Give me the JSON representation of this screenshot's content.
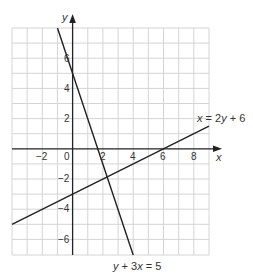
{
  "chart_data": {
    "type": "line",
    "title": "",
    "xlabel": "x",
    "ylabel": "y",
    "xlim": [
      -4,
      9
    ],
    "ylim": [
      -7,
      8
    ],
    "grid": true,
    "x_ticks": [
      "-2",
      "0",
      "2",
      "4",
      "6",
      "8"
    ],
    "x_tick_values": [
      -2,
      0,
      2,
      4,
      6,
      8
    ],
    "y_ticks": [
      "6",
      "4",
      "2",
      "-2",
      "-4",
      "-6"
    ],
    "y_tick_values": [
      6,
      4,
      2,
      -2,
      -4,
      -6
    ],
    "series": [
      {
        "name": "y + 3x = 5",
        "x": [
          -1,
          4
        ],
        "y": [
          8,
          -7
        ]
      },
      {
        "name": "x = 2y + 6",
        "x": [
          -4,
          9
        ],
        "y": [
          -5,
          1.5
        ]
      }
    ],
    "annotations": [
      {
        "text": "x = 2y + 6",
        "near": [
          9,
          2.5
        ]
      },
      {
        "text": "y + 3x = 5",
        "near": [
          3.5,
          -8
        ]
      }
    ]
  },
  "labels": {
    "x_axis": "x",
    "y_axis": "y",
    "eq1": "y + 3x = 5",
    "eq2": "x = 2y + 6",
    "tick_x_m2": "−2",
    "tick_x_0": "0",
    "tick_x_2": "2",
    "tick_x_4": "4",
    "tick_x_6": "6",
    "tick_x_8": "8",
    "tick_y_6": "6",
    "tick_y_4": "4",
    "tick_y_2": "2",
    "tick_y_m2": "−2",
    "tick_y_m4": "−4",
    "tick_y_m6": "−6"
  }
}
